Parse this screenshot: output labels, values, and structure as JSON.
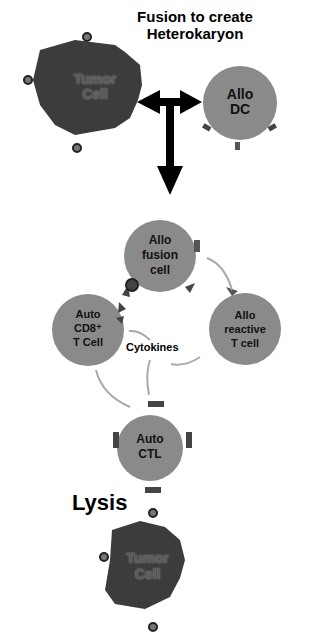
{
  "title": {
    "line1": "Fusion to create",
    "line2": "Heterokaryon"
  },
  "cells": {
    "tumor_top": {
      "line1": "Tumor",
      "line2": "Cell"
    },
    "allo_dc": {
      "line1": "Allo",
      "line2": "DC"
    },
    "allo_fusion": {
      "line1": "Allo",
      "line2": "fusion",
      "line3": "cell"
    },
    "auto_cd8": {
      "line1": "Auto",
      "line2": "CD8⁺",
      "line3": "T Cell"
    },
    "allo_reactive": {
      "line1": "Allo",
      "line2": "reactive",
      "line3": "T cell"
    },
    "auto_ctl": {
      "line1": "Auto",
      "line2": "CTL"
    },
    "tumor_bottom": {
      "line1": "Tumor",
      "line2": "Cell"
    }
  },
  "labels": {
    "cytokines": "Cytokines",
    "lysis": "Lysis"
  },
  "colors": {
    "tumor": "#3a3a3a",
    "immune_cell": "#8a8a8a",
    "arrow": "#000000",
    "thin_arrow": "#b0b0b0"
  }
}
